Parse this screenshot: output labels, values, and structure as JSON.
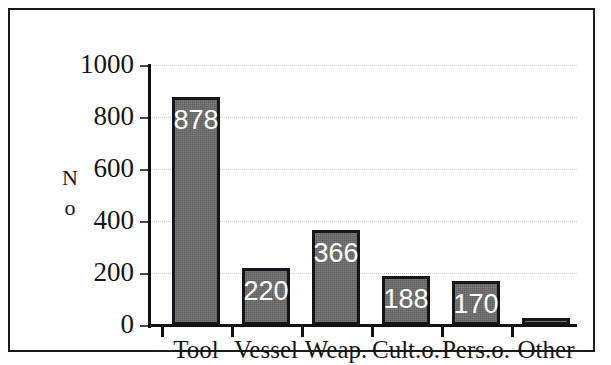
{
  "chart_data": {
    "type": "bar",
    "title": "",
    "subtitle": "",
    "xlabel": "",
    "ylabel": "No",
    "ylabel_lines": [
      "N",
      "o"
    ],
    "categories": [
      "Tool",
      "Vessel",
      "Weap.",
      "Cult.o.",
      "Pers.o.",
      "Other"
    ],
    "values": [
      878,
      220,
      366,
      188,
      170,
      28
    ],
    "value_labels": [
      "878",
      "220",
      "366",
      "188",
      "170",
      ""
    ],
    "ylim": [
      0,
      1000
    ],
    "y_ticks": [
      0,
      200,
      400,
      600,
      800,
      1000
    ],
    "y_tick_labels": [
      "0",
      "200",
      "400",
      "600",
      "800",
      "1000"
    ],
    "grid": true,
    "grid_axis": "y",
    "grid_style": "dotted",
    "legend": false,
    "legend_position": "none",
    "bar_fill_color": "#6b6b6b",
    "bar_edge_color": "#16161a",
    "value_label_color": "#ffffff",
    "axis_color": "#111111",
    "gridline_color": "#c9c9c9",
    "background_color": "#ffffff",
    "frame_color": "#1a1a1a",
    "annotations": []
  }
}
